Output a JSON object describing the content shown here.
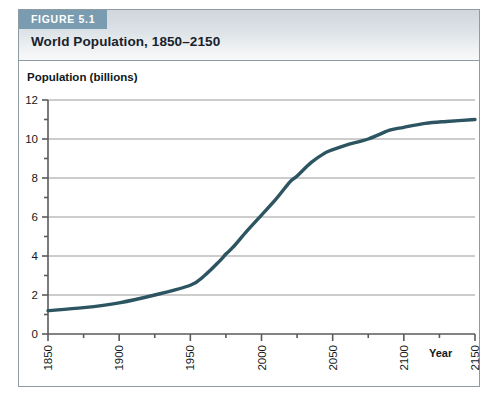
{
  "figure": {
    "badge": "FIGURE 5.1",
    "title": "World Population, 1850–2150"
  },
  "colors": {
    "badge_background": "#7a9cb0",
    "header_band": "#d9dfe4",
    "line": "#2c5461",
    "gridline": "#9a9a9a",
    "axis": "#5a5a5a",
    "border": "#8e9ba3",
    "text": "#111a20"
  },
  "chart_data": {
    "type": "line",
    "title": "World Population, 1850–2150",
    "xlabel": "Year",
    "ylabel": "Population (billions)",
    "xlim": [
      1850,
      2150
    ],
    "ylim": [
      0,
      12
    ],
    "grid": true,
    "grid_axis": "y",
    "legend": null,
    "x_major_ticks": [
      1850,
      1900,
      1950,
      2000,
      2050,
      2100,
      2150
    ],
    "x_minor_ticks": [
      1875,
      1925,
      1975,
      2025,
      2075,
      2125
    ],
    "x_tick_labels": [
      "1850",
      "1900",
      "1950",
      "2000",
      "2050",
      "2100",
      "2150"
    ],
    "x_tick_label_rotation": -90,
    "y_major_ticks": [
      0,
      2,
      4,
      6,
      8,
      10,
      12
    ],
    "y_minor_ticks": [
      1,
      3,
      5,
      7,
      9,
      11
    ],
    "y_tick_labels": [
      "0",
      "2",
      "4",
      "6",
      "8",
      "10",
      "12"
    ],
    "series": [
      {
        "name": "World population",
        "color": "#2c5461",
        "x": [
          1850,
          1875,
          1900,
          1925,
          1950,
          1960,
          1970,
          1975,
          1980,
          1990,
          2000,
          2010,
          2020,
          2025,
          2035,
          2045,
          2050,
          2060,
          2075,
          2090,
          2100,
          2115,
          2130,
          2150
        ],
        "values": [
          1.2,
          1.35,
          1.6,
          2.0,
          2.5,
          3.0,
          3.7,
          4.1,
          4.45,
          5.3,
          6.1,
          6.9,
          7.8,
          8.1,
          8.8,
          9.3,
          9.45,
          9.7,
          10.0,
          10.45,
          10.6,
          10.8,
          10.9,
          11.0
        ]
      }
    ]
  }
}
